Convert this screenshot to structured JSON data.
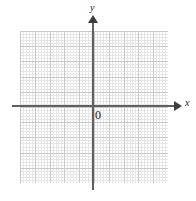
{
  "figure": {
    "type": "coordinate-plane",
    "background_color": "#ffffff"
  },
  "axes": {
    "x_label": "x",
    "y_label": "y",
    "origin_label": "0",
    "axis_color": "#606060",
    "arrow_color": "#3d3d3d"
  },
  "grid": {
    "major_color": "#c9c9c9",
    "minor_color": "#e6e6e6",
    "columns_left_of_y_axis": 5,
    "columns_right_of_y_axis": 5,
    "rows_above_x_axis": 5,
    "rows_below_x_axis": 5
  },
  "chart_data": {
    "type": "scatter",
    "title": "",
    "xlabel": "x",
    "ylabel": "y",
    "x": [],
    "y": [],
    "xlim": [
      -5,
      5
    ],
    "ylim": [
      -5,
      5
    ],
    "xticks": [],
    "yticks": [],
    "grid": true,
    "legend": null,
    "annotations": [
      {
        "text": "0",
        "x": 0,
        "y": 0,
        "role": "origin-label"
      },
      {
        "text": "x",
        "role": "x-axis-label"
      },
      {
        "text": "y",
        "role": "y-axis-label"
      }
    ]
  }
}
